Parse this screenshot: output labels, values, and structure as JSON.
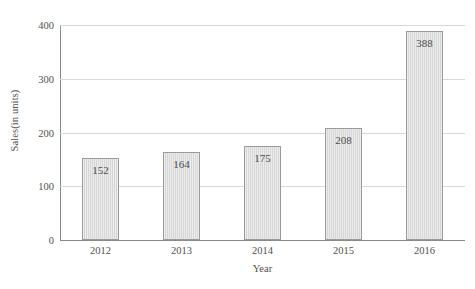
{
  "chart_data": {
    "type": "bar",
    "title": "",
    "subtitle": "",
    "xlabel": "Year",
    "ylabel": "Sales(in units)",
    "categories": [
      "2012",
      "2013",
      "2014",
      "2015",
      "2016"
    ],
    "values": [
      152,
      164,
      175,
      208,
      388
    ],
    "value_labels": [
      "152",
      "164",
      "175",
      "208",
      "388"
    ],
    "ylim": [
      0,
      400
    ],
    "xlim_categories": 5,
    "y_ticks": [
      0,
      100,
      200,
      300,
      400
    ],
    "y_tick_labels": [
      "0",
      "100",
      "200",
      "300",
      "400"
    ],
    "x_tick_labels": [
      "2012",
      "2013",
      "2014",
      "2015",
      "2016"
    ],
    "grid": {
      "horizontal": true,
      "vertical": false,
      "color": "#d8d8d8"
    },
    "legend": {
      "visible": false,
      "position": "none",
      "entries": []
    },
    "annotations": [
      {
        "series": 0,
        "category": "2012",
        "text": "152",
        "position": "inside-top"
      },
      {
        "series": 0,
        "category": "2013",
        "text": "164",
        "position": "inside-top"
      },
      {
        "series": 0,
        "category": "2014",
        "text": "175",
        "position": "inside-top"
      },
      {
        "series": 0,
        "category": "2015",
        "text": "208",
        "position": "inside-top"
      },
      {
        "series": 0,
        "category": "2016",
        "text": "388",
        "position": "inside-top"
      }
    ],
    "style": {
      "bar_fill": "#d6d6d6",
      "bar_edge": "#9a9a9a",
      "axis_color": "#8a8a8a",
      "text_color": "#4f4f4f",
      "background": "#ffffff",
      "bar_texture": "vertical-hatch"
    }
  }
}
